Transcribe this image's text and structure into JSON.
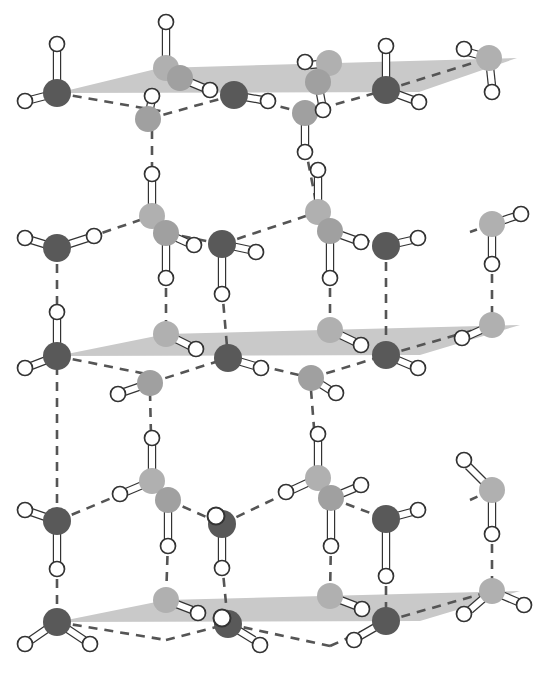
{
  "figure": {
    "width": 541,
    "height": 674,
    "background_color": "#ffffff"
  },
  "legend_colors": {
    "oxygen_front_dark": "#595959",
    "oxygen_back_light": "#b0b0b0",
    "oxygen_mid_light": "#a0a0a0",
    "hydrogen_fill": "#ffffff",
    "hydrogen_stroke": "#333333",
    "bond_rod_fill": "#ffffff",
    "bond_rod_stroke": "#333333",
    "hydrogen_bond_dash": "#555555",
    "basal_plane": "#c9c9c9"
  },
  "style": {
    "oxygen_radius_front": 14,
    "oxygen_radius_back": 13,
    "hydrogen_radius": 7.5,
    "rod_width": 6,
    "dash_pattern": "9 7",
    "dash_width": 2.6
  },
  "basal_planes": [
    {
      "name": "top-basal-plane",
      "points": "57,93 160,68 517,58 419,92"
    },
    {
      "name": "middle-basal-plane",
      "points": "57,356 166,334 520,325 420,355"
    },
    {
      "name": "bottom-basal-plane",
      "points": "57,622 166,600 520,591 420,621"
    }
  ],
  "oxygen_atoms": [
    {
      "id": "o-t-l-front",
      "x": 57,
      "y": 93,
      "shade": "front-dark",
      "layer": "top"
    },
    {
      "id": "o-t-c1-back",
      "x": 166,
      "y": 68,
      "shade": "back-light",
      "layer": "top"
    },
    {
      "id": "o-t-c1-front",
      "x": 180,
      "y": 78,
      "shade": "mid-light",
      "layer": "top"
    },
    {
      "id": "o-t-c2-front",
      "x": 148,
      "y": 119,
      "shade": "mid-light",
      "layer": "top"
    },
    {
      "id": "o-t-mid-dark",
      "x": 234,
      "y": 95,
      "shade": "front-dark",
      "layer": "top"
    },
    {
      "id": "o-t-c3-back",
      "x": 329,
      "y": 63,
      "shade": "back-light",
      "layer": "top"
    },
    {
      "id": "o-t-c3-front",
      "x": 318,
      "y": 82,
      "shade": "mid-light",
      "layer": "top"
    },
    {
      "id": "o-t-c4-front",
      "x": 305,
      "y": 113,
      "shade": "mid-light",
      "layer": "top"
    },
    {
      "id": "o-t-r-front",
      "x": 386,
      "y": 90,
      "shade": "front-dark",
      "layer": "top"
    },
    {
      "id": "o-t-rr-back",
      "x": 489,
      "y": 58,
      "shade": "back-light",
      "layer": "top"
    },
    {
      "id": "o-m-l-front",
      "x": 57,
      "y": 248,
      "shade": "front-dark",
      "layer": "middle-upper"
    },
    {
      "id": "o-m-c1-back",
      "x": 152,
      "y": 216,
      "shade": "back-light",
      "layer": "middle-upper"
    },
    {
      "id": "o-m-c1-front",
      "x": 166,
      "y": 233,
      "shade": "mid-light",
      "layer": "middle-upper"
    },
    {
      "id": "o-m-mid-dark",
      "x": 222,
      "y": 244,
      "shade": "front-dark",
      "layer": "middle-upper"
    },
    {
      "id": "o-m-c3-back",
      "x": 318,
      "y": 212,
      "shade": "back-light",
      "layer": "middle-upper"
    },
    {
      "id": "o-m-c3-front",
      "x": 330,
      "y": 231,
      "shade": "mid-light",
      "layer": "middle-upper"
    },
    {
      "id": "o-m-r-front",
      "x": 386,
      "y": 246,
      "shade": "front-dark",
      "layer": "middle-upper"
    },
    {
      "id": "o-m-rr-back",
      "x": 492,
      "y": 224,
      "shade": "back-light",
      "layer": "middle-upper"
    },
    {
      "id": "o-b-l-front",
      "x": 57,
      "y": 356,
      "shade": "front-dark",
      "layer": "middle"
    },
    {
      "id": "o-b-c1-back",
      "x": 166,
      "y": 334,
      "shade": "back-light",
      "layer": "middle"
    },
    {
      "id": "o-b-c2-front",
      "x": 150,
      "y": 383,
      "shade": "mid-light",
      "layer": "middle"
    },
    {
      "id": "o-b-mid-dark",
      "x": 228,
      "y": 358,
      "shade": "front-dark",
      "layer": "middle"
    },
    {
      "id": "o-b-c3-back",
      "x": 330,
      "y": 330,
      "shade": "back-light",
      "layer": "middle"
    },
    {
      "id": "o-b-c4-front",
      "x": 311,
      "y": 378,
      "shade": "mid-light",
      "layer": "middle"
    },
    {
      "id": "o-b-r-front",
      "x": 386,
      "y": 355,
      "shade": "front-dark",
      "layer": "middle"
    },
    {
      "id": "o-b-rr-back",
      "x": 492,
      "y": 325,
      "shade": "back-light",
      "layer": "middle"
    },
    {
      "id": "o-l-l-front",
      "x": 57,
      "y": 521,
      "shade": "front-dark",
      "layer": "lower-upper"
    },
    {
      "id": "o-l-c1-back",
      "x": 152,
      "y": 481,
      "shade": "back-light",
      "layer": "lower-upper"
    },
    {
      "id": "o-l-c1-front",
      "x": 168,
      "y": 500,
      "shade": "mid-light",
      "layer": "lower-upper"
    },
    {
      "id": "o-l-mid-dark",
      "x": 222,
      "y": 524,
      "shade": "front-dark",
      "layer": "lower-upper"
    },
    {
      "id": "o-l-c3-back",
      "x": 318,
      "y": 478,
      "shade": "back-light",
      "layer": "lower-upper"
    },
    {
      "id": "o-l-c3-front",
      "x": 331,
      "y": 498,
      "shade": "mid-light",
      "layer": "lower-upper"
    },
    {
      "id": "o-l-r-front",
      "x": 386,
      "y": 519,
      "shade": "front-dark",
      "layer": "lower-upper"
    },
    {
      "id": "o-l-rr-back",
      "x": 492,
      "y": 490,
      "shade": "back-light",
      "layer": "lower-upper"
    },
    {
      "id": "o-z-l-front",
      "x": 57,
      "y": 622,
      "shade": "front-dark",
      "layer": "bottom"
    },
    {
      "id": "o-z-c1-back",
      "x": 166,
      "y": 600,
      "shade": "back-light",
      "layer": "bottom"
    },
    {
      "id": "o-z-mid-dark",
      "x": 228,
      "y": 624,
      "shade": "front-dark",
      "layer": "bottom"
    },
    {
      "id": "o-z-c3-back",
      "x": 330,
      "y": 596,
      "shade": "back-light",
      "layer": "bottom"
    },
    {
      "id": "o-z-r-front",
      "x": 386,
      "y": 621,
      "shade": "front-dark",
      "layer": "bottom"
    },
    {
      "id": "o-z-rr-back",
      "x": 492,
      "y": 591,
      "shade": "back-light",
      "layer": "bottom"
    }
  ],
  "covalent_bonds": [
    {
      "from": [
        57,
        93
      ],
      "to": [
        57,
        50
      ]
    },
    {
      "from": [
        57,
        93
      ],
      "to": [
        30,
        100
      ]
    },
    {
      "from": [
        166,
        68
      ],
      "to": [
        166,
        28
      ]
    },
    {
      "from": [
        180,
        78
      ],
      "to": [
        204,
        88
      ]
    },
    {
      "from": [
        148,
        119
      ],
      "to": [
        152,
        98
      ]
    },
    {
      "from": [
        234,
        95
      ],
      "to": [
        262,
        100
      ]
    },
    {
      "from": [
        329,
        63
      ],
      "to": [
        310,
        65
      ]
    },
    {
      "from": [
        318,
        82
      ],
      "to": [
        322,
        104
      ]
    },
    {
      "from": [
        305,
        113
      ],
      "to": [
        305,
        146
      ]
    },
    {
      "from": [
        386,
        90
      ],
      "to": [
        386,
        52
      ]
    },
    {
      "from": [
        386,
        90
      ],
      "to": [
        413,
        100
      ]
    },
    {
      "from": [
        489,
        58
      ],
      "to": [
        468,
        52
      ]
    },
    {
      "from": [
        489,
        58
      ],
      "to": [
        492,
        86
      ]
    },
    {
      "from": [
        57,
        248
      ],
      "to": [
        31,
        240
      ]
    },
    {
      "from": [
        57,
        248
      ],
      "to": [
        88,
        238
      ]
    },
    {
      "from": [
        152,
        216
      ],
      "to": [
        152,
        180
      ]
    },
    {
      "from": [
        166,
        233
      ],
      "to": [
        188,
        243
      ]
    },
    {
      "from": [
        166,
        233
      ],
      "to": [
        166,
        272
      ]
    },
    {
      "from": [
        222,
        244
      ],
      "to": [
        250,
        250
      ]
    },
    {
      "from": [
        222,
        244
      ],
      "to": [
        222,
        288
      ]
    },
    {
      "from": [
        318,
        212
      ],
      "to": [
        318,
        176
      ]
    },
    {
      "from": [
        330,
        231
      ],
      "to": [
        355,
        240
      ]
    },
    {
      "from": [
        330,
        231
      ],
      "to": [
        330,
        272
      ]
    },
    {
      "from": [
        386,
        246
      ],
      "to": [
        412,
        240
      ]
    },
    {
      "from": [
        492,
        224
      ],
      "to": [
        516,
        216
      ]
    },
    {
      "from": [
        492,
        224
      ],
      "to": [
        492,
        258
      ]
    },
    {
      "from": [
        57,
        356
      ],
      "to": [
        57,
        318
      ]
    },
    {
      "from": [
        57,
        356
      ],
      "to": [
        31,
        366
      ]
    },
    {
      "from": [
        166,
        334
      ],
      "to": [
        190,
        346
      ]
    },
    {
      "from": [
        150,
        383
      ],
      "to": [
        124,
        392
      ]
    },
    {
      "from": [
        228,
        358
      ],
      "to": [
        255,
        366
      ]
    },
    {
      "from": [
        330,
        330
      ],
      "to": [
        355,
        342
      ]
    },
    {
      "from": [
        311,
        378
      ],
      "to": [
        330,
        390
      ]
    },
    {
      "from": [
        386,
        355
      ],
      "to": [
        412,
        366
      ]
    },
    {
      "from": [
        492,
        325
      ],
      "to": [
        468,
        336
      ]
    },
    {
      "from": [
        57,
        521
      ],
      "to": [
        31,
        512
      ]
    },
    {
      "from": [
        57,
        521
      ],
      "to": [
        57,
        563
      ]
    },
    {
      "from": [
        152,
        481
      ],
      "to": [
        152,
        444
      ]
    },
    {
      "from": [
        168,
        500
      ],
      "to": [
        168,
        540
      ]
    },
    {
      "from": [
        152,
        481
      ],
      "to": [
        126,
        492
      ]
    },
    {
      "from": [
        222,
        524
      ],
      "to": [
        222,
        562
      ]
    },
    {
      "from": [
        318,
        478
      ],
      "to": [
        318,
        440
      ]
    },
    {
      "from": [
        318,
        478
      ],
      "to": [
        292,
        490
      ]
    },
    {
      "from": [
        331,
        498
      ],
      "to": [
        355,
        488
      ]
    },
    {
      "from": [
        331,
        498
      ],
      "to": [
        331,
        540
      ]
    },
    {
      "from": [
        386,
        519
      ],
      "to": [
        412,
        512
      ]
    },
    {
      "from": [
        386,
        519
      ],
      "to": [
        386,
        570
      ]
    },
    {
      "from": [
        492,
        490
      ],
      "to": [
        468,
        466
      ]
    },
    {
      "from": [
        492,
        490
      ],
      "to": [
        492,
        528
      ]
    },
    {
      "from": [
        57,
        622
      ],
      "to": [
        31,
        640
      ]
    },
    {
      "from": [
        57,
        622
      ],
      "to": [
        84,
        640
      ]
    },
    {
      "from": [
        166,
        600
      ],
      "to": [
        192,
        610
      ]
    },
    {
      "from": [
        228,
        624
      ],
      "to": [
        254,
        640
      ]
    },
    {
      "from": [
        330,
        596
      ],
      "to": [
        356,
        606
      ]
    },
    {
      "from": [
        386,
        621
      ],
      "to": [
        360,
        636
      ]
    },
    {
      "from": [
        492,
        591
      ],
      "to": [
        518,
        602
      ]
    },
    {
      "from": [
        492,
        591
      ],
      "to": [
        470,
        610
      ]
    }
  ],
  "hydrogen_bonds": [
    {
      "from": [
        57,
        93
      ],
      "to": [
        166,
        112
      ]
    },
    {
      "from": [
        148,
        119
      ],
      "to": [
        234,
        95
      ]
    },
    {
      "from": [
        234,
        95
      ],
      "to": [
        305,
        113
      ]
    },
    {
      "from": [
        305,
        113
      ],
      "to": [
        386,
        90
      ]
    },
    {
      "from": [
        386,
        90
      ],
      "to": [
        489,
        58
      ]
    },
    {
      "from": [
        152,
        98
      ],
      "to": [
        152,
        216
      ]
    },
    {
      "from": [
        305,
        146
      ],
      "to": [
        318,
        212
      ]
    },
    {
      "from": [
        57,
        248
      ],
      "to": [
        152,
        216
      ]
    },
    {
      "from": [
        166,
        233
      ],
      "to": [
        222,
        244
      ]
    },
    {
      "from": [
        222,
        244
      ],
      "to": [
        318,
        212
      ]
    },
    {
      "from": [
        330,
        231
      ],
      "to": [
        386,
        246
      ]
    },
    {
      "from": [
        492,
        224
      ],
      "to": [
        470,
        232
      ]
    },
    {
      "from": [
        57,
        248
      ],
      "to": [
        57,
        356
      ]
    },
    {
      "from": [
        166,
        272
      ],
      "to": [
        166,
        334
      ]
    },
    {
      "from": [
        222,
        288
      ],
      "to": [
        228,
        358
      ]
    },
    {
      "from": [
        330,
        272
      ],
      "to": [
        330,
        330
      ]
    },
    {
      "from": [
        386,
        246
      ],
      "to": [
        386,
        355
      ]
    },
    {
      "from": [
        492,
        258
      ],
      "to": [
        492,
        325
      ]
    },
    {
      "from": [
        57,
        356
      ],
      "to": [
        166,
        378
      ]
    },
    {
      "from": [
        150,
        383
      ],
      "to": [
        228,
        358
      ]
    },
    {
      "from": [
        228,
        358
      ],
      "to": [
        311,
        378
      ]
    },
    {
      "from": [
        311,
        378
      ],
      "to": [
        386,
        355
      ]
    },
    {
      "from": [
        386,
        355
      ],
      "to": [
        492,
        325
      ]
    },
    {
      "from": [
        57,
        366
      ],
      "to": [
        57,
        521
      ]
    },
    {
      "from": [
        150,
        392
      ],
      "to": [
        152,
        481
      ]
    },
    {
      "from": [
        311,
        390
      ],
      "to": [
        318,
        478
      ]
    },
    {
      "from": [
        57,
        521
      ],
      "to": [
        152,
        481
      ]
    },
    {
      "from": [
        168,
        500
      ],
      "to": [
        222,
        524
      ]
    },
    {
      "from": [
        222,
        524
      ],
      "to": [
        318,
        478
      ]
    },
    {
      "from": [
        331,
        498
      ],
      "to": [
        386,
        519
      ]
    },
    {
      "from": [
        492,
        490
      ],
      "to": [
        470,
        500
      ]
    },
    {
      "from": [
        57,
        563
      ],
      "to": [
        57,
        622
      ]
    },
    {
      "from": [
        168,
        540
      ],
      "to": [
        166,
        600
      ]
    },
    {
      "from": [
        222,
        562
      ],
      "to": [
        228,
        624
      ]
    },
    {
      "from": [
        331,
        540
      ],
      "to": [
        330,
        596
      ]
    },
    {
      "from": [
        386,
        570
      ],
      "to": [
        386,
        621
      ]
    },
    {
      "from": [
        492,
        528
      ],
      "to": [
        492,
        591
      ]
    },
    {
      "from": [
        57,
        622
      ],
      "to": [
        166,
        640
      ]
    },
    {
      "from": [
        166,
        640
      ],
      "to": [
        228,
        624
      ]
    },
    {
      "from": [
        228,
        624
      ],
      "to": [
        330,
        646
      ]
    },
    {
      "from": [
        330,
        646
      ],
      "to": [
        386,
        621
      ]
    },
    {
      "from": [
        386,
        621
      ],
      "to": [
        492,
        591
      ]
    }
  ],
  "hydrogen_atoms": [
    {
      "x": 57,
      "y": 44
    },
    {
      "x": 25,
      "y": 101
    },
    {
      "x": 166,
      "y": 22
    },
    {
      "x": 210,
      "y": 90
    },
    {
      "x": 152,
      "y": 96
    },
    {
      "x": 268,
      "y": 101
    },
    {
      "x": 305,
      "y": 62
    },
    {
      "x": 323,
      "y": 110
    },
    {
      "x": 305,
      "y": 152
    },
    {
      "x": 386,
      "y": 46
    },
    {
      "x": 419,
      "y": 102
    },
    {
      "x": 464,
      "y": 49
    },
    {
      "x": 492,
      "y": 92
    },
    {
      "x": 25,
      "y": 238
    },
    {
      "x": 94,
      "y": 236
    },
    {
      "x": 152,
      "y": 174
    },
    {
      "x": 194,
      "y": 245
    },
    {
      "x": 166,
      "y": 278
    },
    {
      "x": 256,
      "y": 252
    },
    {
      "x": 222,
      "y": 294
    },
    {
      "x": 318,
      "y": 170
    },
    {
      "x": 361,
      "y": 242
    },
    {
      "x": 330,
      "y": 278
    },
    {
      "x": 418,
      "y": 238
    },
    {
      "x": 521,
      "y": 214
    },
    {
      "x": 492,
      "y": 264
    },
    {
      "x": 57,
      "y": 312
    },
    {
      "x": 25,
      "y": 368
    },
    {
      "x": 196,
      "y": 349
    },
    {
      "x": 118,
      "y": 394
    },
    {
      "x": 261,
      "y": 368
    },
    {
      "x": 361,
      "y": 345
    },
    {
      "x": 336,
      "y": 393
    },
    {
      "x": 418,
      "y": 368
    },
    {
      "x": 462,
      "y": 338
    },
    {
      "x": 25,
      "y": 510
    },
    {
      "x": 57,
      "y": 569
    },
    {
      "x": 152,
      "y": 438
    },
    {
      "x": 120,
      "y": 494
    },
    {
      "x": 168,
      "y": 546
    },
    {
      "x": 222,
      "y": 568
    },
    {
      "x": 318,
      "y": 434
    },
    {
      "x": 286,
      "y": 492
    },
    {
      "x": 361,
      "y": 485
    },
    {
      "x": 331,
      "y": 546
    },
    {
      "x": 418,
      "y": 510
    },
    {
      "x": 386,
      "y": 576
    },
    {
      "x": 464,
      "y": 460
    },
    {
      "x": 492,
      "y": 534
    },
    {
      "x": 25,
      "y": 644
    },
    {
      "x": 90,
      "y": 644
    },
    {
      "x": 198,
      "y": 613
    },
    {
      "x": 260,
      "y": 645
    },
    {
      "x": 362,
      "y": 609
    },
    {
      "x": 354,
      "y": 640
    },
    {
      "x": 524,
      "y": 605
    },
    {
      "x": 464,
      "y": 614
    }
  ],
  "on_atom_hydrogens": [
    {
      "x": 216,
      "y": 516
    },
    {
      "x": 222,
      "y": 618
    }
  ]
}
